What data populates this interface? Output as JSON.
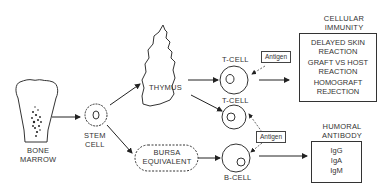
{
  "nodes": {
    "bone_marrow": "BONE\nMARROW",
    "bone_marrow_l1": "BONE",
    "bone_marrow_l2": "MARROW",
    "stem_cell_l1": "STEM",
    "stem_cell_l2": "CELL",
    "thymus": "THYMUS",
    "bursa_l1": "BURSA",
    "bursa_l2": "EQUIVALENT",
    "t_cell_1": "T-CELL",
    "t_cell_2": "T-CELL",
    "b_cell": "B-CELL",
    "antigen_top": "Antigen",
    "antigen_bottom": "Antigen"
  },
  "cellular": {
    "title_l1": "CELLULAR",
    "title_l2": "IMMUNITY",
    "items": [
      "DELAYED SKIN",
      "REACTION",
      "GRAFT VS HOST",
      "REACTION",
      "HOMOGRAFT",
      "REJECTION"
    ]
  },
  "humoral": {
    "title_l1": "HUMORAL",
    "title_l2": "ANTIBODY",
    "items": [
      "IgG",
      "IgA",
      "IgM"
    ]
  }
}
